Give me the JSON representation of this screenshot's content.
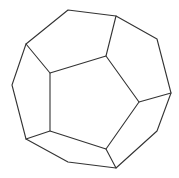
{
  "diagram": {
    "type": "polyhedron-line-drawing",
    "stroke_color": "#333333",
    "background": "#ffffff",
    "outer_outline": [
      [
        68,
        10
      ],
      [
        116,
        16
      ],
      [
        157,
        39
      ],
      [
        171,
        93
      ],
      [
        157,
        131
      ],
      [
        116,
        168
      ],
      [
        68,
        162
      ],
      [
        26,
        139
      ],
      [
        12,
        85
      ],
      [
        26,
        44
      ]
    ],
    "front_face": [
      [
        50,
        73
      ],
      [
        106,
        56
      ],
      [
        139,
        102
      ],
      [
        106,
        149
      ],
      [
        50,
        131
      ]
    ],
    "connecting_edges": [
      [
        [
          26,
          44
        ],
        [
          50,
          73
        ]
      ],
      [
        [
          116,
          16
        ],
        [
          106,
          56
        ]
      ],
      [
        [
          171,
          93
        ],
        [
          139,
          102
        ]
      ],
      [
        [
          116,
          168
        ],
        [
          106,
          149
        ]
      ],
      [
        [
          26,
          139
        ],
        [
          50,
          131
        ]
      ]
    ]
  }
}
